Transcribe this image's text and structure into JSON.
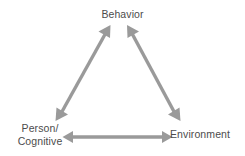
{
  "diagram": {
    "background_color": "#ffffff",
    "arrow_color": "#9a9a9a",
    "text_color": "#4c4c4c",
    "nodes": [
      {
        "id": "behavior",
        "label": "Behavior",
        "position": "top-center"
      },
      {
        "id": "person-cognitive",
        "label_line1": "Person/",
        "label_line2": "Cognitive",
        "label": "Person/Cognitive",
        "position": "bottom-left"
      },
      {
        "id": "environment",
        "label": "Environment",
        "position": "bottom-right"
      }
    ],
    "connectors": [
      {
        "id": "behavior-person",
        "from": "behavior",
        "to": "person-cognitive",
        "style": "double-headed-arrow",
        "orientation": "diagonal-left"
      },
      {
        "id": "behavior-environment",
        "from": "behavior",
        "to": "environment",
        "style": "double-headed-arrow",
        "orientation": "diagonal-right"
      },
      {
        "id": "person-environment",
        "from": "person-cognitive",
        "to": "environment",
        "style": "double-headed-arrow",
        "orientation": "horizontal"
      }
    ]
  }
}
